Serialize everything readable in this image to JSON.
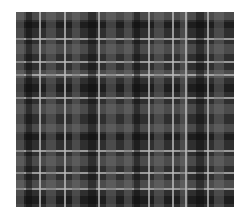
{
  "image": {
    "subject": "tartan plaid fabric pattern",
    "palette": {
      "background": "#2f2f2f",
      "mid_stripe": "#5a5a5a",
      "dark_stripe": "#1a1a1a",
      "light_line": "#b4b4b4"
    },
    "region": {
      "x": 16,
      "y": 12,
      "width": 218,
      "height": 195
    },
    "vertical_bands": [
      {
        "x": 0,
        "w": 8,
        "kind": "mid"
      },
      {
        "x": 10,
        "w": 6,
        "kind": "dark"
      },
      {
        "x": 23,
        "w": 2,
        "kind": "light"
      },
      {
        "x": 30,
        "w": 10,
        "kind": "mid"
      },
      {
        "x": 48,
        "w": 2,
        "kind": "light"
      },
      {
        "x": 56,
        "w": 8,
        "kind": "mid"
      },
      {
        "x": 72,
        "w": 8,
        "kind": "dark"
      },
      {
        "x": 82,
        "w": 2,
        "kind": "light"
      },
      {
        "x": 90,
        "w": 10,
        "kind": "mid"
      },
      {
        "x": 108,
        "w": 8,
        "kind": "mid"
      },
      {
        "x": 118,
        "w": 6,
        "kind": "dark"
      },
      {
        "x": 132,
        "w": 2,
        "kind": "light"
      },
      {
        "x": 138,
        "w": 10,
        "kind": "mid"
      },
      {
        "x": 156,
        "w": 2,
        "kind": "light"
      },
      {
        "x": 164,
        "w": 8,
        "kind": "mid"
      },
      {
        "x": 169,
        "w": 2,
        "kind": "light"
      },
      {
        "x": 180,
        "w": 8,
        "kind": "dark"
      },
      {
        "x": 191,
        "w": 2,
        "kind": "light"
      },
      {
        "x": 198,
        "w": 10,
        "kind": "mid"
      }
    ],
    "horizontal_bands": [
      {
        "y": 0,
        "w": 8,
        "kind": "mid"
      },
      {
        "y": 10,
        "w": 6,
        "kind": "dark"
      },
      {
        "y": 26,
        "w": 2,
        "kind": "light"
      },
      {
        "y": 32,
        "w": 10,
        "kind": "mid"
      },
      {
        "y": 49,
        "w": 2,
        "kind": "light"
      },
      {
        "y": 58,
        "w": 8,
        "kind": "mid"
      },
      {
        "y": 62,
        "w": 2,
        "kind": "light"
      },
      {
        "y": 72,
        "w": 8,
        "kind": "dark"
      },
      {
        "y": 85,
        "w": 2,
        "kind": "light"
      },
      {
        "y": 92,
        "w": 10,
        "kind": "mid"
      },
      {
        "y": 112,
        "w": 8,
        "kind": "mid"
      },
      {
        "y": 122,
        "w": 6,
        "kind": "dark"
      },
      {
        "y": 138,
        "w": 2,
        "kind": "light"
      },
      {
        "y": 144,
        "w": 10,
        "kind": "mid"
      },
      {
        "y": 160,
        "w": 2,
        "kind": "light"
      },
      {
        "y": 168,
        "w": 8,
        "kind": "mid"
      },
      {
        "y": 176,
        "w": 2,
        "kind": "light"
      },
      {
        "y": 184,
        "w": 8,
        "kind": "dark"
      }
    ]
  }
}
